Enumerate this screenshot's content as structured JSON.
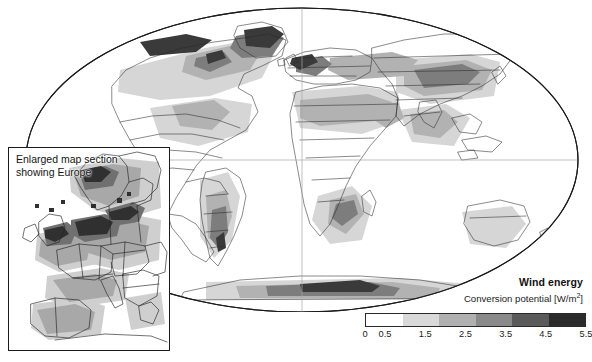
{
  "figure": {
    "type": "world-map",
    "projection": "mollweide-elliptical",
    "background": "#ffffff",
    "outline_color": "#1b1b1b",
    "graticule_color": "#9a9a9a"
  },
  "inset": {
    "caption_line1": "Enlarged map section",
    "caption_line2": "showing Europe",
    "border_color": "#1b1b1b"
  },
  "legend": {
    "title": "Wind energy",
    "subtitle_prefix": "Conversion potential [W/m",
    "subtitle_sup": "2",
    "subtitle_suffix": "]",
    "tick_labels": [
      "0",
      "0.5",
      "1.5",
      "2.5",
      "3.5",
      "4.5",
      "5.5"
    ],
    "tick_positions_pct": [
      0,
      9.09,
      27.27,
      45.45,
      63.64,
      81.82,
      100
    ],
    "band_colors": [
      "#ffffff",
      "#d9d9d9",
      "#b0b0b0",
      "#8a8a8a",
      "#5a5a5a",
      "#2b2b2b"
    ],
    "band_labels": [
      "0–0.5",
      "0.5–1.5",
      "1.5–2.5",
      "2.5–3.5",
      "3.5–4.5",
      "4.5–5.5"
    ]
  },
  "chart_data": {
    "type": "heatmap",
    "title": "Wind energy",
    "subtitle": "Conversion potential [W/m2]",
    "unit": "W/m2",
    "colorbar_breaks": [
      0,
      0.5,
      1.5,
      2.5,
      3.5,
      4.5,
      5.5
    ],
    "colorbar_colors": [
      "#ffffff",
      "#d9d9d9",
      "#b0b0b0",
      "#8a8a8a",
      "#5a5a5a",
      "#2b2b2b"
    ],
    "legend_position": "bottom-right",
    "grid": true,
    "xlabel": "",
    "ylabel": "",
    "regions": [
      {
        "name": "Greenland",
        "class": 5,
        "value": 4.8
      },
      {
        "name": "Canadian Arctic",
        "class": 4,
        "value": 3.9
      },
      {
        "name": "Central North America",
        "class": 3,
        "value": 2.2
      },
      {
        "name": "Patagonia",
        "class": 5,
        "value": 4.9
      },
      {
        "name": "Sahara",
        "class": 3,
        "value": 2.4
      },
      {
        "name": "Horn of Africa",
        "class": 3,
        "value": 2.6
      },
      {
        "name": "Southern Africa",
        "class": 3,
        "value": 2.3
      },
      {
        "name": "Central Asia",
        "class": 3,
        "value": 2.5
      },
      {
        "name": "Tibetan Plateau",
        "class": 3,
        "value": 2.7
      },
      {
        "name": "Northern Europe",
        "class": 4,
        "value": 3.6
      },
      {
        "name": "British Isles",
        "class": 5,
        "value": 4.6
      },
      {
        "name": "North Sea coast",
        "class": 5,
        "value": 4.7
      },
      {
        "name": "Scandinavian mountains",
        "class": 5,
        "value": 4.5
      },
      {
        "name": "Antarctica",
        "class": 4,
        "value": 3.8
      },
      {
        "name": "Australia interior",
        "class": 2,
        "value": 1.2
      },
      {
        "name": "Amazon basin",
        "class": 1,
        "value": 0.3
      },
      {
        "name": "Congo basin",
        "class": 1,
        "value": 0.3
      },
      {
        "name": "Southeast Asia",
        "class": 1,
        "value": 0.4
      }
    ]
  }
}
